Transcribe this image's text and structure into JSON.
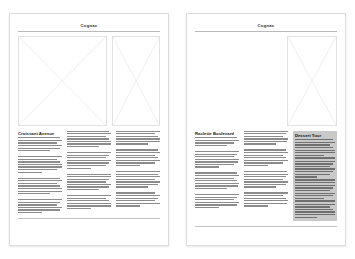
{
  "spread": {
    "background_color": "#ffffff",
    "page_border_color": "#dcdcdc",
    "rule_color": "#b9b9b9",
    "body_text_color": "#8c8c8c",
    "shaded_box_color": "#c9c9c9",
    "placeholder_stroke_color": "#e6e6e6"
  },
  "pages": [
    {
      "running_head": "Cognac",
      "figures": [
        {
          "name": "figure-wide",
          "alt": "image-placeholder"
        },
        {
          "name": "figure-tall",
          "alt": "image-placeholder"
        }
      ],
      "columns": [
        {
          "title": "Croissant Avenue",
          "shaded": false
        },
        {
          "title": "",
          "shaded": false
        },
        {
          "title": "",
          "shaded": false
        }
      ]
    },
    {
      "running_head": "Cognac",
      "figures": [
        {
          "name": "figure-tall",
          "alt": "image-placeholder"
        }
      ],
      "columns": [
        {
          "title": "Raclette Boulevard",
          "shaded": false
        },
        {
          "title": "",
          "shaded": false
        },
        {
          "title": "Dessert Tour",
          "shaded": true
        }
      ]
    }
  ]
}
